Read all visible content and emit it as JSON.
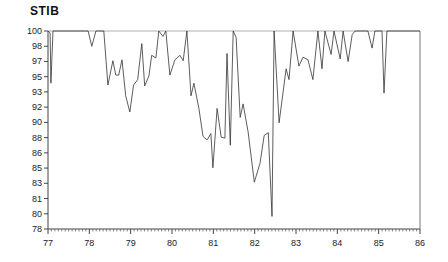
{
  "chart_data": {
    "type": "line",
    "title": "STIB",
    "xlabel": "",
    "ylabel": "",
    "xlim": [
      77,
      86
    ],
    "ylim": [
      78,
      100
    ],
    "x_ticks": [
      "77",
      "78",
      "79",
      "80",
      "81",
      "82",
      "83",
      "84",
      "85",
      "86"
    ],
    "y_ticks": [
      "100",
      "98",
      "97",
      "95",
      "93",
      "92",
      "90",
      "88",
      "86",
      "85",
      "83",
      "81",
      "80",
      "78"
    ],
    "grid": false,
    "legend": null,
    "line_color": "#333333",
    "series": [
      {
        "name": "STIB",
        "x": [
          77.0,
          77.05,
          77.07,
          77.12,
          77.97,
          78.06,
          78.16,
          78.35,
          78.45,
          78.57,
          78.64,
          78.71,
          78.79,
          78.88,
          78.98,
          79.07,
          79.17,
          79.27,
          79.34,
          79.44,
          79.51,
          79.61,
          79.68,
          79.78,
          79.85,
          79.95,
          80.07,
          80.19,
          80.27,
          80.36,
          80.46,
          80.53,
          80.65,
          80.75,
          80.85,
          80.94,
          80.99,
          81.09,
          81.19,
          81.28,
          81.33,
          81.41,
          81.48,
          81.55,
          81.65,
          81.72,
          81.84,
          81.99,
          82.13,
          82.23,
          82.33,
          82.42,
          82.47,
          82.59,
          82.76,
          82.83,
          82.93,
          83.07,
          83.17,
          83.29,
          83.41,
          83.53,
          83.63,
          83.7,
          83.85,
          83.92,
          84.07,
          84.14,
          84.26,
          84.36,
          84.43,
          84.74,
          84.84,
          84.91,
          85.08,
          85.13,
          85.2,
          86.0
        ],
        "values": [
          100,
          99.8,
          94.2,
          100,
          100,
          98.3,
          100,
          100,
          94.0,
          96.7,
          95.1,
          95.1,
          96.8,
          92.8,
          91.0,
          94.0,
          94.6,
          98.6,
          93.9,
          95.0,
          97.3,
          97.0,
          100,
          99.4,
          100,
          95.1,
          96.8,
          97.3,
          96.7,
          100,
          92.8,
          94.2,
          91.4,
          88.3,
          87.9,
          88.6,
          84.8,
          91.4,
          88.2,
          88.1,
          97.5,
          87.3,
          100,
          99.3,
          90.4,
          91.9,
          88.8,
          83.2,
          85.3,
          88.4,
          88.7,
          79.4,
          100,
          89.8,
          95.8,
          94.6,
          100,
          96.1,
          97.1,
          96.8,
          94.6,
          100,
          95.8,
          100,
          97.4,
          100,
          96.9,
          100,
          96.6,
          99.6,
          100,
          100,
          98.1,
          100,
          100,
          93.1,
          100,
          100
        ]
      }
    ]
  }
}
